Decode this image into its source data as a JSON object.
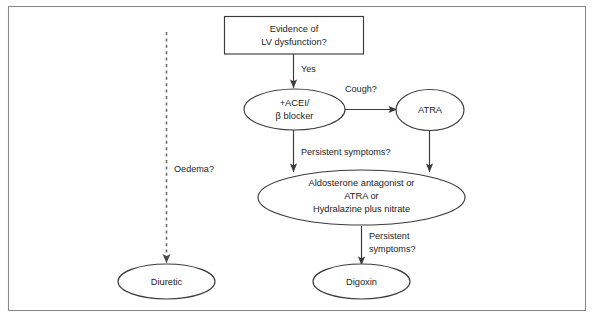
{
  "figure": {
    "kind": "clinical-treatment-flowchart",
    "frame": {
      "border_color": "#8a8a8a",
      "background_color": "#ffffff"
    },
    "line_color": "#3b3b3b",
    "dashed_line_color": "#6d6d6d",
    "text_color": "#1d1d1d"
  },
  "nodes": {
    "start_box": {
      "shape": "rectangle",
      "line1": "Evidence of",
      "line2": "LV dysfunction?"
    },
    "acei_beta_blocker": {
      "shape": "ellipse",
      "line1": "+ACEI/",
      "line2": "β blocker"
    },
    "atra": {
      "shape": "ellipse",
      "line1": "ATRA"
    },
    "second_line": {
      "shape": "ellipse",
      "line1": "Aldosterone antagonist or",
      "line2": "ATRA or",
      "line3": "Hydralazine plus nitrate"
    },
    "diuretic": {
      "shape": "ellipse",
      "line1": "Diuretic"
    },
    "digoxin": {
      "shape": "ellipse",
      "line1": "Digoxin"
    }
  },
  "edge_labels": {
    "yes": "Yes",
    "cough": "Cough?",
    "oedema": "Oedema?",
    "persistent_symptoms_mid": "Persistent symptoms?",
    "persistent_symptoms_low_line1": "Persistent",
    "persistent_symptoms_low_line2": "symptoms?"
  }
}
